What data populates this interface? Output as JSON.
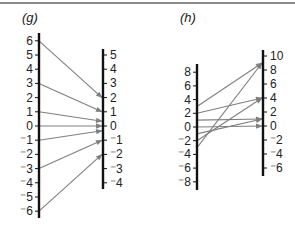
{
  "chart_data": [
    {
      "type": "mapping-diagram",
      "title": "(g)",
      "function": "f(x) = x/3",
      "left_axis": {
        "ticks": [
          6,
          5,
          4,
          3,
          2,
          1,
          0,
          -1,
          -2,
          -3,
          -4,
          -5,
          -6
        ],
        "labels": [
          "6",
          "5",
          "4",
          "3",
          "2",
          "1",
          "0",
          "-1",
          "-2",
          "-3",
          "-4",
          "-5",
          "-6"
        ]
      },
      "right_axis": {
        "ticks": [
          5,
          4,
          3,
          2,
          1,
          0,
          -1,
          -2,
          -3,
          -4
        ],
        "labels": [
          "5",
          "4",
          "3",
          "2",
          "1",
          "0",
          "-1",
          "-2",
          "-3",
          "-4"
        ]
      },
      "mappings": [
        [
          6,
          2
        ],
        [
          3,
          1
        ],
        [
          1,
          0.333
        ],
        [
          0,
          0
        ],
        [
          -1,
          -0.333
        ],
        [
          -3,
          -1
        ],
        [
          -6,
          -2
        ]
      ]
    },
    {
      "type": "mapping-diagram",
      "title": "(h)",
      "function": "f(x) = x^2",
      "left_axis": {
        "ticks": [
          8,
          6,
          4,
          2,
          0,
          -2,
          -4,
          -6,
          -8
        ],
        "labels": [
          "8",
          "6",
          "4",
          "2",
          "0",
          "-2",
          "-4",
          "-6",
          "-8"
        ]
      },
      "right_axis": {
        "ticks": [
          10,
          8,
          6,
          4,
          2,
          0,
          -2,
          -4,
          -6
        ],
        "labels": [
          "10",
          "8",
          "6",
          "4",
          "2",
          "0",
          "-2",
          "-4",
          "-6"
        ]
      },
      "mappings": [
        [
          3,
          9
        ],
        [
          2,
          4
        ],
        [
          1,
          1
        ],
        [
          0,
          0
        ],
        [
          -1,
          1
        ],
        [
          -2,
          4
        ],
        [
          -3,
          9
        ]
      ]
    }
  ],
  "colors": {
    "axis": "#111111",
    "arrow": "#7f7f7f",
    "text": "#222222",
    "rule": "#8a8a8a"
  }
}
